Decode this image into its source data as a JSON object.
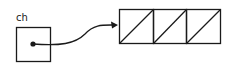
{
  "diagram": {
    "variable": {
      "label": "ch",
      "box": {
        "x": 16,
        "y": 27,
        "width": 34,
        "height": 35
      },
      "dot": {
        "cx": 33,
        "cy": 44,
        "r": 2.6
      }
    },
    "pointer": {
      "path": "M33,44 C60,46 75,44 85,34 C94,24 103,25 117,25",
      "arrowhead": "117,25 111,21 112,29"
    },
    "array": {
      "x": 119,
      "y": 9,
      "cell_width": 34,
      "cell_height": 34,
      "cell_count": 3,
      "cells": [
        "null",
        "null",
        "null"
      ]
    },
    "colors": {
      "stroke": "#1a1a1a",
      "background": "#ffffff"
    }
  }
}
